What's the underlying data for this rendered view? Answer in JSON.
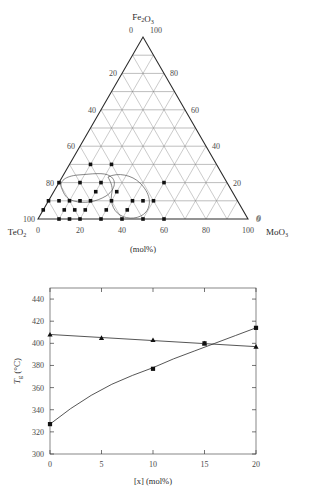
{
  "figure": {
    "caption_mid": "(mol%)"
  },
  "ternary": {
    "type": "ternary-scatter",
    "title": "",
    "vertices": {
      "top": "Fe2O3",
      "top_html": "Fe₂O₃",
      "bottom_left": "TeO2",
      "bottom_left_html": "TeO₂",
      "bottom_right": "MoO3",
      "bottom_right_html": "MoO₃"
    },
    "corner_values": {
      "top_left_of_apex": "0",
      "top_right_of_apex": "100",
      "bottom_left_start": "0",
      "bottom_left_outer": "100",
      "bottom_right_end": "100",
      "bottom_right_outer": "0"
    },
    "axis_units": "(mol%)",
    "left_axis_ticks": [
      "20",
      "40",
      "60",
      "80",
      "100"
    ],
    "right_axis_ticks": [
      "80",
      "60",
      "40",
      "20",
      "0"
    ],
    "bottom_axis_ticks": [
      "0",
      "20",
      "40",
      "60",
      "80",
      "100"
    ],
    "grid_step": 10,
    "points": [
      {
        "te": 60,
        "fe": 30,
        "mo": 10
      },
      {
        "te": 60,
        "fe": 20,
        "mo": 20
      },
      {
        "te": 60,
        "fe": 10,
        "mo": 30
      },
      {
        "te": 50,
        "fe": 30,
        "mo": 20
      },
      {
        "te": 70,
        "fe": 20,
        "mo": 10
      },
      {
        "te": 70,
        "fe": 10,
        "mo": 20
      },
      {
        "te": 80,
        "fe": 10,
        "mo": 10
      },
      {
        "te": 80,
        "fe": 20,
        "mo": 0
      },
      {
        "te": 90,
        "fe": 10,
        "mo": 0
      },
      {
        "te": 85,
        "fe": 10,
        "mo": 5
      },
      {
        "te": 85,
        "fe": 5,
        "mo": 10
      },
      {
        "te": 80,
        "fe": 5,
        "mo": 15
      },
      {
        "te": 75,
        "fe": 10,
        "mo": 15
      },
      {
        "te": 70,
        "fe": 0,
        "mo": 30
      },
      {
        "te": 75,
        "fe": 5,
        "mo": 20
      },
      {
        "te": 60,
        "fe": 0,
        "mo": 40
      },
      {
        "te": 55,
        "fe": 5,
        "mo": 40
      },
      {
        "te": 50,
        "fe": 10,
        "mo": 40
      },
      {
        "te": 45,
        "fe": 10,
        "mo": 45
      },
      {
        "te": 40,
        "fe": 0,
        "mo": 60
      },
      {
        "te": 50,
        "fe": 0,
        "mo": 50
      },
      {
        "te": 40,
        "fe": 10,
        "mo": 50
      },
      {
        "te": 30,
        "fe": 20,
        "mo": 50
      },
      {
        "te": 90,
        "fe": 0,
        "mo": 10
      },
      {
        "te": 95,
        "fe": 5,
        "mo": 0
      },
      {
        "te": 65,
        "fe": 15,
        "mo": 20
      },
      {
        "te": 55,
        "fe": 15,
        "mo": 30
      },
      {
        "te": 65,
        "fe": 5,
        "mo": 30
      },
      {
        "te": 85,
        "fe": 0,
        "mo": 15
      },
      {
        "te": 80,
        "fe": 0,
        "mo": 20
      }
    ]
  },
  "chart_data": {
    "type": "line",
    "title": "",
    "xlabel": "[x] (mol%)",
    "ylabel": "Tg (°C)",
    "ylabel_main": "T",
    "ylabel_sub": "g",
    "ylabel_unit": "(°C)",
    "xlim": [
      0,
      20
    ],
    "ylim": [
      300,
      450
    ],
    "xticks": [
      0,
      5,
      10,
      15,
      20
    ],
    "yticks": [
      300,
      320,
      340,
      360,
      380,
      400,
      420,
      440
    ],
    "xtick_labels": [
      "0",
      "5",
      "10",
      "15",
      "20"
    ],
    "ytick_labels": [
      "300",
      "320",
      "340",
      "360",
      "380",
      "400",
      "420",
      "440"
    ],
    "grid": false,
    "legend": "none",
    "series": [
      {
        "name": "rising",
        "marker": "square",
        "x": [
          0,
          10,
          15,
          20
        ],
        "values": [
          327,
          377,
          400,
          414
        ],
        "fit_x": [
          0,
          2,
          4,
          6,
          8,
          10,
          12,
          14,
          16,
          18,
          20
        ],
        "fit_y": [
          327,
          341,
          353,
          363,
          371,
          378,
          386,
          393,
          400,
          407,
          414
        ]
      },
      {
        "name": "flat",
        "marker": "triangle",
        "x": [
          0,
          5,
          10,
          15,
          20
        ],
        "values": [
          408,
          405,
          403,
          400,
          397
        ],
        "fit_x": [
          0,
          20
        ],
        "fit_y": [
          408,
          397
        ]
      }
    ]
  }
}
